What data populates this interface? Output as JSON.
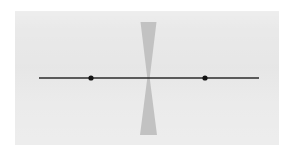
{
  "figure": {
    "title": "",
    "caption": "",
    "canvas": {
      "width": 295,
      "height": 154
    },
    "background_color": "#ffffff",
    "panel": {
      "fill_color": "#e9e9e9",
      "x": 15,
      "y": 11,
      "width": 264,
      "height": 134
    }
  },
  "chart_data": {
    "type": "scatter",
    "title": "",
    "subtitle": "",
    "xlabel": "",
    "ylabel": "",
    "grid": false,
    "legend": null,
    "axis_line": {
      "name": "horizontal-number-line",
      "orientation": "horizontal",
      "x_start": 39,
      "x_end": 259,
      "y": 78,
      "stroke_color": "#2b2b2b",
      "stroke_width": 1.6
    },
    "points": [
      {
        "label": "",
        "x": 91,
        "y": 78,
        "radius": 2.6,
        "color": "#141414"
      },
      {
        "label": "",
        "x": 205,
        "y": 78,
        "radius": 2.6,
        "color": "#141414"
      }
    ],
    "shapes": [
      {
        "name": "bowtie-hourglass",
        "type": "bowtie",
        "orientation": "vertical",
        "fill_color": "#c2c2c2",
        "center_x": 148.5,
        "center_y": 78,
        "top_y": 22,
        "bottom_y": 135,
        "top_half_width": 8,
        "bottom_half_width": 8.5,
        "waist_half_width": 1.2
      }
    ],
    "annotations": []
  }
}
